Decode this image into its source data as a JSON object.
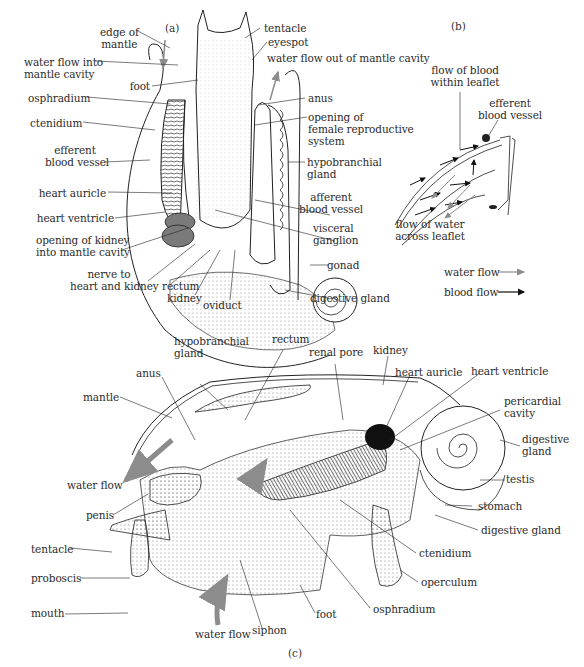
{
  "figure": {
    "panels": [
      {
        "id": "a",
        "label": "(a)"
      },
      {
        "id": "b",
        "label": "(b)"
      },
      {
        "id": "c",
        "label": "(c)"
      }
    ]
  },
  "panel_a": {
    "labels_left": [
      {
        "lines": [
          "edge of",
          "mantle"
        ]
      },
      {
        "lines": [
          "water flow into",
          "mantle cavity"
        ]
      },
      {
        "lines": [
          "foot"
        ]
      },
      {
        "lines": [
          "osphradium"
        ]
      },
      {
        "lines": [
          "ctenidium"
        ]
      },
      {
        "lines": [
          "efferent",
          "blood vessel"
        ]
      },
      {
        "lines": [
          "heart auricle"
        ]
      },
      {
        "lines": [
          "heart ventricle"
        ]
      },
      {
        "lines": [
          "opening of kidney",
          "into mantle cavity"
        ]
      },
      {
        "lines": [
          "nerve to",
          "heart and kidney"
        ]
      },
      {
        "lines": [
          "rectum"
        ]
      },
      {
        "lines": [
          "kidney"
        ]
      },
      {
        "lines": [
          "oviduct"
        ]
      }
    ],
    "labels_right": [
      {
        "lines": [
          "tentacle"
        ]
      },
      {
        "lines": [
          "eyespot"
        ]
      },
      {
        "lines": [
          "water flow out of mantle cavity"
        ]
      },
      {
        "lines": [
          "anus"
        ]
      },
      {
        "lines": [
          "opening of",
          "female reproductive",
          "system"
        ]
      },
      {
        "lines": [
          "hypobranchial",
          "gland"
        ]
      },
      {
        "lines": [
          "afferent",
          "blood vessel"
        ]
      },
      {
        "lines": [
          "visceral",
          "ganglion"
        ]
      },
      {
        "lines": [
          "gonad"
        ]
      },
      {
        "lines": [
          "digestive gland"
        ]
      }
    ]
  },
  "panel_b": {
    "labels": [
      {
        "lines": [
          "flow of blood",
          "within leaflet"
        ]
      },
      {
        "lines": [
          "efferent",
          "blood vessel"
        ]
      },
      {
        "lines": [
          "flow of water",
          "across leaflet"
        ]
      }
    ],
    "legend": [
      {
        "label": "water flow",
        "color": "#8c8c8c"
      },
      {
        "label": "blood flow",
        "color": "#111111"
      }
    ]
  },
  "panel_c": {
    "labels": [
      {
        "lines": [
          "hypobranchial",
          "gland"
        ]
      },
      {
        "lines": [
          "rectum"
        ]
      },
      {
        "lines": [
          "renal pore"
        ]
      },
      {
        "lines": [
          "kidney"
        ]
      },
      {
        "lines": [
          "anus"
        ]
      },
      {
        "lines": [
          "heart auricle"
        ]
      },
      {
        "lines": [
          "heart ventricle"
        ]
      },
      {
        "lines": [
          "mantle"
        ]
      },
      {
        "lines": [
          "pericardial",
          "cavity"
        ]
      },
      {
        "lines": [
          "digestive",
          "gland"
        ]
      },
      {
        "lines": [
          "water flow"
        ]
      },
      {
        "lines": [
          "testis"
        ]
      },
      {
        "lines": [
          "penis"
        ]
      },
      {
        "lines": [
          "stomach"
        ]
      },
      {
        "lines": [
          "digestive gland"
        ]
      },
      {
        "lines": [
          "ctenidium"
        ]
      },
      {
        "lines": [
          "tentacle"
        ]
      },
      {
        "lines": [
          "proboscis"
        ]
      },
      {
        "lines": [
          "operculum"
        ]
      },
      {
        "lines": [
          "mouth"
        ]
      },
      {
        "lines": [
          "osphradium"
        ]
      },
      {
        "lines": [
          "foot"
        ]
      },
      {
        "lines": [
          "water flow"
        ]
      },
      {
        "lines": [
          "siphon"
        ]
      }
    ]
  },
  "colors": {
    "water_arrow": "#8c8c8c",
    "blood_arrow": "#111111",
    "heart_fill": "#7a7a7a",
    "ink": "#2b2b2b"
  }
}
